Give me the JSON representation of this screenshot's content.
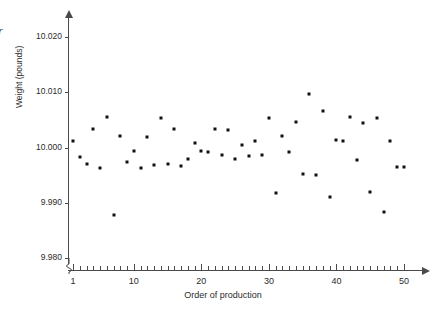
{
  "figure": {
    "edge_artifact": "r",
    "ylabel": "Weight (pounds)",
    "xlabel": "Order of production"
  },
  "chart_data": {
    "type": "scatter",
    "title": "",
    "subtitle": "",
    "xlabel": "Order of production",
    "ylabel": "Weight (pounds)",
    "xlim": [
      0.2,
      52.5
    ],
    "ylim": [
      9.98,
      10.0215
    ],
    "grid": false,
    "legend": null,
    "xticks": [
      1,
      10,
      20,
      30,
      40,
      50
    ],
    "xtick_labels": [
      "1",
      "10",
      "20",
      "30",
      "40",
      "50"
    ],
    "xtick_minor_step": 1,
    "yticks": [
      9.98,
      9.99,
      10.0,
      10.01,
      10.02
    ],
    "ytick_labels": [
      "9.980",
      "9.990",
      "10.000",
      "10.010",
      "10.020"
    ],
    "axis_break_y": true,
    "marker": "square",
    "marker_color": "#111111",
    "marker_size": 3,
    "x": [
      1,
      2,
      3,
      4,
      5,
      6,
      7,
      8,
      9,
      10,
      11,
      12,
      13,
      14,
      15,
      16,
      17,
      18,
      19,
      20,
      21,
      22,
      23,
      24,
      25,
      26,
      27,
      28,
      29,
      30,
      31,
      32,
      33,
      34,
      35,
      36,
      37,
      38,
      39,
      40,
      41,
      42,
      43,
      44,
      45,
      46,
      47,
      48,
      49,
      50
    ],
    "y": [
      10.0012,
      9.9983,
      9.9971,
      10.0033,
      9.9962,
      10.0055,
      9.9877,
      10.002,
      9.9974,
      9.9993,
      9.9963,
      10.0019,
      9.9969,
      10.0054,
      9.9971,
      10.0034,
      9.9967,
      9.9979,
      10.0009,
      9.9993,
      9.9991,
      10.0033,
      9.9987,
      10.0031,
      9.998,
      10.0004,
      9.9985,
      10.0011,
      9.9986,
      10.0053,
      9.9917,
      10.002,
      9.9992,
      10.0046,
      9.9952,
      10.0097,
      9.9951,
      10.0066,
      9.991,
      10.0014,
      10.0011,
      10.0056,
      9.9977,
      10.0045,
      9.9919,
      10.0053,
      9.9883,
      10.0012,
      9.9964,
      9.9964
    ],
    "points": [
      {
        "order": 1,
        "weight": 10.0012
      },
      {
        "order": 2,
        "weight": 9.9983
      },
      {
        "order": 3,
        "weight": 9.9971
      },
      {
        "order": 4,
        "weight": 10.0033
      },
      {
        "order": 5,
        "weight": 9.9962
      },
      {
        "order": 6,
        "weight": 10.0055
      },
      {
        "order": 7,
        "weight": 9.9877
      },
      {
        "order": 8,
        "weight": 10.002
      },
      {
        "order": 9,
        "weight": 9.9974
      },
      {
        "order": 10,
        "weight": 9.9993
      },
      {
        "order": 11,
        "weight": 9.9963
      },
      {
        "order": 12,
        "weight": 10.0019
      },
      {
        "order": 13,
        "weight": 9.9969
      },
      {
        "order": 14,
        "weight": 10.0054
      },
      {
        "order": 15,
        "weight": 9.9971
      },
      {
        "order": 16,
        "weight": 10.0034
      },
      {
        "order": 17,
        "weight": 9.9967
      },
      {
        "order": 18,
        "weight": 9.9979
      },
      {
        "order": 19,
        "weight": 10.0009
      },
      {
        "order": 20,
        "weight": 9.9993
      },
      {
        "order": 21,
        "weight": 9.9991
      },
      {
        "order": 22,
        "weight": 10.0033
      },
      {
        "order": 23,
        "weight": 9.9987
      },
      {
        "order": 24,
        "weight": 10.0031
      },
      {
        "order": 25,
        "weight": 9.998
      },
      {
        "order": 26,
        "weight": 10.0004
      },
      {
        "order": 27,
        "weight": 9.9985
      },
      {
        "order": 28,
        "weight": 10.0011
      },
      {
        "order": 29,
        "weight": 9.9986
      },
      {
        "order": 30,
        "weight": 10.0053
      },
      {
        "order": 31,
        "weight": 9.9917
      },
      {
        "order": 32,
        "weight": 10.002
      },
      {
        "order": 33,
        "weight": 9.9992
      },
      {
        "order": 34,
        "weight": 10.0046
      },
      {
        "order": 35,
        "weight": 9.9952
      },
      {
        "order": 36,
        "weight": 10.0097
      },
      {
        "order": 37,
        "weight": 9.9951
      },
      {
        "order": 38,
        "weight": 10.0066
      },
      {
        "order": 39,
        "weight": 9.991
      },
      {
        "order": 40,
        "weight": 10.0014
      },
      {
        "order": 41,
        "weight": 10.0011
      },
      {
        "order": 42,
        "weight": 10.0056
      },
      {
        "order": 43,
        "weight": 9.9977
      },
      {
        "order": 44,
        "weight": 10.0045
      },
      {
        "order": 45,
        "weight": 9.9919
      },
      {
        "order": 46,
        "weight": 10.0053
      },
      {
        "order": 47,
        "weight": 9.9883
      },
      {
        "order": 48,
        "weight": 10.0012
      },
      {
        "order": 49,
        "weight": 9.9964
      },
      {
        "order": 50,
        "weight": 9.9964
      }
    ]
  }
}
